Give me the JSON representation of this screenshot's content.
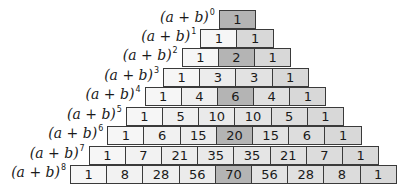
{
  "labels": [
    {
      "base": "(a + b)",
      "exp": "0"
    },
    {
      "base": "(a + b)",
      "exp": "1"
    },
    {
      "base": "(a + b)",
      "exp": "2"
    },
    {
      "base": "(a + b)",
      "exp": "3"
    },
    {
      "base": "(a + b)",
      "exp": "4"
    },
    {
      "base": "(a + b)",
      "exp": "5"
    },
    {
      "base": "(a + b)",
      "exp": "6"
    },
    {
      "base": "(a + b)",
      "exp": "7"
    },
    {
      "base": "(a + b)",
      "exp": "8"
    }
  ],
  "rows": [
    [
      1
    ],
    [
      1,
      1
    ],
    [
      1,
      2,
      1
    ],
    [
      1,
      3,
      3,
      1
    ],
    [
      1,
      4,
      6,
      4,
      1
    ],
    [
      1,
      5,
      10,
      10,
      5,
      1
    ],
    [
      1,
      6,
      15,
      20,
      15,
      6,
      1
    ],
    [
      1,
      7,
      21,
      35,
      35,
      21,
      7,
      1
    ],
    [
      1,
      8,
      28,
      56,
      70,
      56,
      28,
      8,
      1
    ]
  ],
  "colors": {
    "cell_light": "#f4f4f4",
    "cell_mid": "#dedede",
    "cell_center": "#b4b4b4",
    "border": "#3a3a3a",
    "text": "#1a1a1a"
  }
}
